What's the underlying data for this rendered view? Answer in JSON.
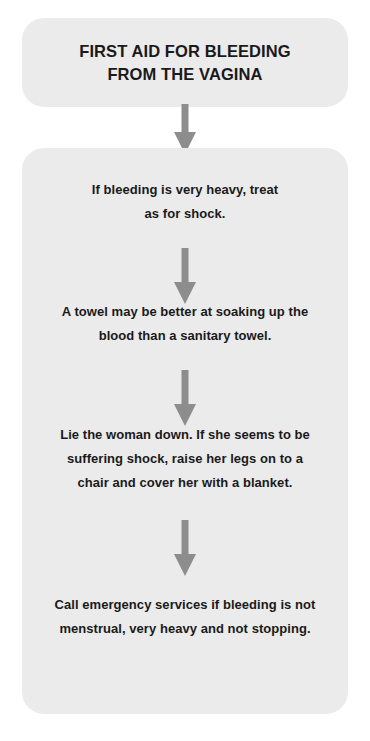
{
  "document": {
    "kind": "first-aid-flowchart",
    "background_color": "#ffffff",
    "box_color": "#ebebeb",
    "arrow_color": "#8d8d8d",
    "text_color": "#1a1a1a"
  },
  "title": {
    "line1": "FIRST AID FOR BLEEDING",
    "line2": "FROM THE VAGINA"
  },
  "steps": [
    {
      "index": 1,
      "line1": "If bleeding is very heavy, treat",
      "line2": "as for shock.",
      "line3": ""
    },
    {
      "index": 2,
      "line1": "A towel may be better at soaking up the",
      "line2": "blood than a sanitary towel.",
      "line3": ""
    },
    {
      "index": 3,
      "line1": "Lie the woman down. If she seems to be",
      "line2": "suffering shock, raise her legs on to a",
      "line3": "chair and cover her with a blanket."
    },
    {
      "index": 4,
      "line1": "Call emergency services if bleeding is not",
      "line2": "menstrual, very heavy and not stopping.",
      "line3": ""
    }
  ],
  "arrows": {
    "title_to_panel": "down-arrow",
    "step1_to_step2": "down-arrow",
    "step2_to_step3": "down-arrow",
    "step3_to_step4": "down-arrow"
  }
}
